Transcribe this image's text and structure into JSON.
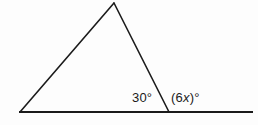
{
  "figure": {
    "type": "geometry-diagram",
    "background_color": "#fdfdfd",
    "stroke_color": "#1b1b1b",
    "text_color": "#1b1b1b",
    "labels": {
      "interior_angle": "30°",
      "exterior_angle_prefix": "(6",
      "exterior_angle_variable": "x",
      "exterior_angle_suffix": ")°"
    },
    "geometry": {
      "apex": {
        "x": 114,
        "y": 3
      },
      "left_vertex": {
        "x": 20,
        "y": 112
      },
      "right_vertex": {
        "x": 169,
        "y": 112
      },
      "baseline_start": {
        "x": 19,
        "y": 112
      },
      "baseline_end": {
        "x": 253,
        "y": 112
      },
      "stroke_width_triangle": 1.6,
      "stroke_width_baseline": 2
    }
  }
}
